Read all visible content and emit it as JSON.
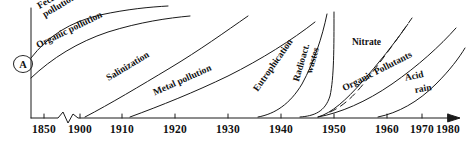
{
  "figure": {
    "panel_letter": "A",
    "background": "#ffffff",
    "line_color": "#1a1a1a"
  },
  "chart_data": {
    "type": "line",
    "title": "",
    "subtitle": "",
    "xlabel": "",
    "ylabel": "",
    "xlim": [
      1850,
      1983
    ],
    "ylim": [
      0,
      100
    ],
    "grid": false,
    "legend": "inline-labels",
    "axis_break": {
      "present": true,
      "between": [
        1850,
        1900
      ]
    },
    "x_axis_arrow": true,
    "tick_labels": [
      "1850",
      "1900",
      "1910",
      "1920",
      "1930",
      "1940",
      "1950",
      "1960",
      "1970",
      "1980"
    ],
    "tick_values": [
      1850,
      1900,
      1910,
      1920,
      1930,
      1940,
      1950,
      1960,
      1970,
      1980
    ],
    "series": [
      {
        "name": "Fecal pollution",
        "label_lines": [
          "Fecal",
          "pollution"
        ],
        "x": [
          1850,
          1860,
          1875,
          1890,
          1905,
          1920,
          1930,
          1935
        ],
        "values": [
          55,
          68,
          80,
          90,
          95,
          98,
          99,
          99
        ]
      },
      {
        "name": "Organic pollution",
        "label_lines": [
          "Organic pollution"
        ],
        "x": [
          1850,
          1865,
          1880,
          1897,
          1912,
          1928,
          1940,
          1948
        ],
        "values": [
          30,
          44,
          58,
          72,
          84,
          91,
          95,
          96
        ]
      },
      {
        "name": "Salinization",
        "label_lines": [
          "Salinization"
        ],
        "x": [
          1899,
          1910,
          1922,
          1935,
          1948,
          1958,
          1966
        ],
        "values": [
          2,
          16,
          34,
          54,
          74,
          88,
          96
        ]
      },
      {
        "name": "Metal pollution",
        "label_lines": [
          "Metal pollution"
        ],
        "x": [
          1910,
          1922,
          1934,
          1946,
          1958,
          1968,
          1976
        ],
        "values": [
          1,
          14,
          30,
          48,
          66,
          82,
          92
        ]
      },
      {
        "name": "Eutrophication",
        "label_lines": [
          "Eutrophication"
        ],
        "x": [
          1938,
          1944,
          1949,
          1953,
          1957,
          1961,
          1964
        ],
        "values": [
          2,
          14,
          36,
          60,
          80,
          92,
          98
        ]
      },
      {
        "name": "Radioactive wastes",
        "label_lines": [
          "Radioact.",
          "wastes"
        ],
        "x": [
          1946,
          1949,
          1950.5,
          1951.5,
          1953,
          1956
        ],
        "values": [
          2,
          20,
          50,
          76,
          90,
          99
        ],
        "style": "solid"
      },
      {
        "name": "Nitrate",
        "label_lines": [
          "Nitrate"
        ],
        "x": [
          1953,
          1959,
          1964,
          1969,
          1974
        ],
        "values": [
          2,
          22,
          45,
          68,
          90
        ],
        "style": "dashed"
      },
      {
        "name": "Organic Pollutants",
        "label_lines": [
          "Organic Pollutants"
        ],
        "x": [
          1952,
          1958,
          1964,
          1970,
          1976,
          1981
        ],
        "values": [
          2,
          16,
          35,
          56,
          78,
          96
        ]
      },
      {
        "name": "Acid rain",
        "label_lines": [
          "Acid",
          "rain"
        ],
        "x": [
          1963,
          1968,
          1973,
          1977,
          1981
        ],
        "values": [
          2,
          18,
          42,
          66,
          88
        ]
      }
    ]
  },
  "labels": {
    "fecal_line1": "Fecal",
    "fecal_line2": "pollution",
    "organic_pollution": "Organic pollution",
    "salinization": "Salinization",
    "metal_pollution": "Metal pollution",
    "eutrophication": "Eutrophication",
    "radioact": "Radioact.",
    "wastes": "wastes",
    "nitrate": "Nitrate",
    "organic_pollutants": "Organic Pollutants",
    "acid": "Acid",
    "rain": "rain"
  },
  "axis": {
    "ticks": [
      {
        "label": "1850",
        "x": 44
      },
      {
        "label": "1900",
        "x": 80
      },
      {
        "label": "1910",
        "x": 122
      },
      {
        "label": "1920",
        "x": 175
      },
      {
        "label": "1930",
        "x": 228
      },
      {
        "label": "1940",
        "x": 281
      },
      {
        "label": "1950",
        "x": 334
      },
      {
        "label": "1960",
        "x": 387
      },
      {
        "label": "1970",
        "x": 422
      },
      {
        "label": "1980",
        "x": 448
      }
    ]
  }
}
